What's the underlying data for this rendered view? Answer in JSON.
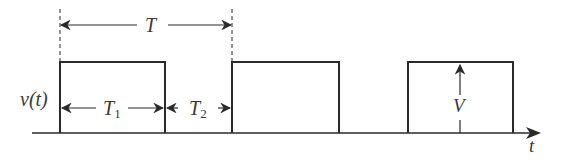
{
  "diagram": {
    "type": "rectangular pulse train",
    "signal_label": "v(t)",
    "axis_label": "t",
    "period_label": "T",
    "on_time_label": "T",
    "on_time_sub": "1",
    "off_time_label": "T",
    "off_time_sub": "2",
    "amplitude_label": "V",
    "pulse_count": 3,
    "colors": {
      "line": "#2a2a2a",
      "text": "#3a3a3a",
      "background": "#ffffff"
    }
  }
}
